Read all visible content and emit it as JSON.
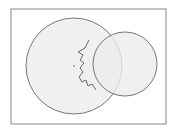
{
  "diagram": {
    "frame": {
      "x": 11,
      "y": 9,
      "w": 155,
      "h": 115,
      "stroke": "#888888"
    },
    "circles": [
      {
        "name": "large-circle",
        "cx": 74,
        "cy": 66,
        "r": 48,
        "fill": "#ececec",
        "stroke": "#777777"
      },
      {
        "name": "small-circle",
        "cx": 125,
        "cy": 64,
        "r": 32,
        "fill": "#ececec",
        "stroke": "#777777"
      }
    ],
    "center_dot": {
      "cx": 74,
      "cy": 66,
      "r": 1,
      "fill": "#999999"
    },
    "jagged_line": "M89,40 L85,48 L78,52 L83,55 L80,60 L84,63 L80,68 L83,72 L79,77 L82,82 L86,80 L88,86 L92,84 L96,90",
    "colors": {
      "stroke": "#777777",
      "fill": "#ececec",
      "line": "#444444"
    }
  }
}
